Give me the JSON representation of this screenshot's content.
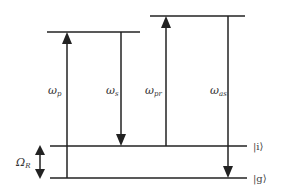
{
  "diagram": {
    "type": "energy-level-diagram",
    "levels": [
      {
        "id": "upper-1",
        "label": "",
        "y": 32,
        "x1": 47,
        "x2": 140
      },
      {
        "id": "upper-2",
        "label": "",
        "y": 16,
        "x1": 150,
        "x2": 245
      },
      {
        "id": "intermediate",
        "label": "|i⟩",
        "y": 146,
        "x1": 50,
        "x2": 247
      },
      {
        "id": "ground",
        "label": "|g⟩",
        "y": 178,
        "x1": 50,
        "x2": 247
      }
    ],
    "transitions": [
      {
        "id": "pump",
        "label_main": "ω",
        "label_sub": "p",
        "direction": "up",
        "x": 67,
        "y_from": 178,
        "y_to": 32,
        "label_x": 48,
        "label_y": 94
      },
      {
        "id": "stokes",
        "label_main": "ω",
        "label_sub": "s",
        "direction": "down",
        "x": 121,
        "y_from": 32,
        "y_to": 146,
        "label_x": 106,
        "label_y": 94
      },
      {
        "id": "probe",
        "label_main": "ω",
        "label_sub": "pr",
        "direction": "up",
        "x": 166,
        "y_from": 146,
        "y_to": 16,
        "label_x": 145,
        "label_y": 94
      },
      {
        "id": "anti-stokes",
        "label_main": "ω",
        "label_sub": "as",
        "direction": "down",
        "x": 228,
        "y_from": 16,
        "y_to": 178,
        "label_x": 210,
        "label_y": 94
      }
    ],
    "raman_shift": {
      "label_main": "Ω",
      "label_sub": "R",
      "x": 40,
      "y_from": 146,
      "y_to": 178,
      "label_x": 16,
      "label_y": 166
    },
    "colors": {
      "line": "#222222",
      "text": "#333333",
      "background": "#ffffff"
    }
  }
}
